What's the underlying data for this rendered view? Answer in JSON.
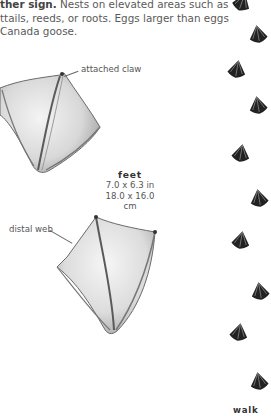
{
  "paragraph": {
    "lead": "ther sign.",
    "line1_rest": " Nests on elevated areas such as",
    "line2": "ttails, reeds, or roots. Eggs larger than eggs",
    "line3": " Canada goose."
  },
  "annotations": {
    "attached_claw": "attached claw",
    "distal_web": "distal web"
  },
  "feet_caption": {
    "title": "feet",
    "imperial": "7.0 x 6.3 in",
    "metric": "18.0 x 16.0 cm"
  },
  "track_pattern": {
    "label": "walk",
    "tracks": [
      {
        "x": 232,
        "y": -8,
        "rot": 200
      },
      {
        "x": 248,
        "y": 24,
        "rot": 170
      },
      {
        "x": 227,
        "y": 59,
        "rot": 190
      },
      {
        "x": 248,
        "y": 95,
        "rot": 170
      },
      {
        "x": 231,
        "y": 143,
        "rot": 190
      },
      {
        "x": 249,
        "y": 188,
        "rot": 170
      },
      {
        "x": 231,
        "y": 230,
        "rot": 190
      },
      {
        "x": 250,
        "y": 281,
        "rot": 170
      },
      {
        "x": 229,
        "y": 322,
        "rot": 190
      },
      {
        "x": 249,
        "y": 371,
        "rot": 170
      }
    ]
  },
  "colors": {
    "text": "#5a5a5a",
    "track_fill": "#222222",
    "sketch": "#8a8a8a"
  }
}
